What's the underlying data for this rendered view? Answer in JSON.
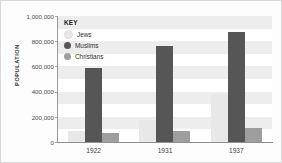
{
  "chart_data": {
    "type": "bar",
    "title": "",
    "xlabel": "",
    "ylabel": "POPULATION",
    "ylim": [
      0,
      1000000
    ],
    "grid": true,
    "legend_position": "inside-top-left",
    "legend_title": "KEY",
    "categories": [
      "1922",
      "1931",
      "1937"
    ],
    "ytick_labels": [
      "0",
      "200,000",
      "400,000",
      "600,000",
      "800,000",
      "1,000,000"
    ],
    "ytick_values": [
      0,
      200000,
      400000,
      600000,
      800000,
      1000000
    ],
    "series": [
      {
        "name": "Jews",
        "color": "#e8e8e8",
        "values": [
          84000,
          175000,
          385000
        ]
      },
      {
        "name": "Muslims",
        "color": "#565656",
        "values": [
          589000,
          760000,
          875000
        ]
      },
      {
        "name": "Christians",
        "color": "#9e9e9e",
        "values": [
          71000,
          89000,
          110000
        ]
      }
    ]
  },
  "colors": {
    "plot_background": "#ffffff",
    "band": "#ededed",
    "axis": "#9a9a9a",
    "frame": "#d9d9d9",
    "text": "#333333"
  }
}
